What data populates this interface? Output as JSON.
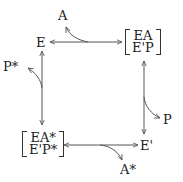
{
  "diagram": {
    "nodes": {
      "top_left": {
        "label": "E"
      },
      "top_right": {
        "row1": "EA",
        "row2": "E'P"
      },
      "bottom_left": {
        "row1": "EA*",
        "row2": "E'P*"
      },
      "bottom_right": {
        "label": "E'"
      }
    },
    "side_products": {
      "top": "A",
      "left": "P*",
      "right": "P",
      "bottom": "A*"
    },
    "edges": [
      {
        "from": "E",
        "to": "[EA / E'P]",
        "type": "bidirectional",
        "branch": "A"
      },
      {
        "from": "[EA / E'P]",
        "to": "E'",
        "type": "bidirectional",
        "branch": "P"
      },
      {
        "from": "E'",
        "to": "[EA* / E'P*]",
        "type": "bidirectional",
        "branch": "A*"
      },
      {
        "from": "[EA* / E'P*]",
        "to": "E",
        "type": "bidirectional",
        "branch": "P*"
      }
    ],
    "stroke_color": "#555555",
    "text_color": "#222222"
  }
}
